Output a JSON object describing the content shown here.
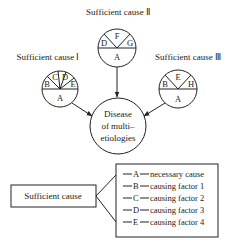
{
  "diagram": {
    "causes": [
      {
        "title": "Sufficient cause Ⅰ",
        "segments": [
          "B",
          "C",
          "D",
          "E"
        ],
        "base": "A"
      },
      {
        "title": "Sufficient cause Ⅱ",
        "segments": [
          "D",
          "F",
          "G"
        ],
        "base": "A"
      },
      {
        "title": "Sufficient cause Ⅲ",
        "segments": [
          "B",
          "E",
          "H"
        ],
        "base": "A"
      }
    ],
    "disease": {
      "line1": "Disease",
      "line2": "of multi–",
      "line3": "etiologies"
    },
    "legend": {
      "box_label": "Sufficient cause",
      "items": [
        {
          "key": "A",
          "text": "necessary cause"
        },
        {
          "key": "B",
          "text": "causing factor 1"
        },
        {
          "key": "C",
          "text": "causing factor 2"
        },
        {
          "key": "D",
          "text": "causing factor 3"
        },
        {
          "key": "E",
          "text": "causing factor 4"
        }
      ]
    }
  }
}
